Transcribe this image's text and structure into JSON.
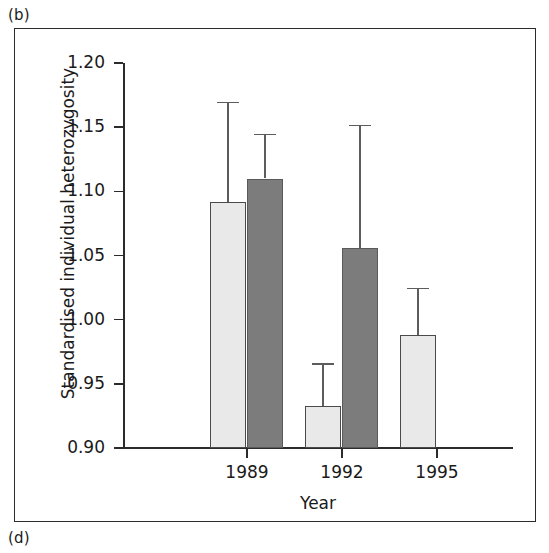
{
  "panel_labels": {
    "top": "(b)",
    "bottom": "(d)"
  },
  "chart_data": {
    "type": "bar",
    "title": "",
    "subtitle": "",
    "xlabel": "Year",
    "ylabel": "Standardised individual heterozygosity",
    "categories": [
      "1989",
      "1992",
      "1995"
    ],
    "ylim": [
      0.9,
      1.2
    ],
    "yticks": [
      "0.90",
      "0.95",
      "1.00",
      "1.05",
      "1.10",
      "1.15",
      "1.20"
    ],
    "ytick_values": [
      0.9,
      0.95,
      1.0,
      1.05,
      1.1,
      1.15,
      1.2
    ],
    "grid": false,
    "legend": "none",
    "error_bars": "upper only (SE/CI)",
    "colors": {
      "light_bar_fill": "#e9e9e9",
      "light_bar_edge": "#4a4a4a",
      "dark_bar_fill": "#7c7c7c",
      "dark_bar_edge": "#5a5a5a",
      "axis": "#2b2b2b",
      "error_bar": "#5c5c5c",
      "frame": "#2b2b2b",
      "background": "#ffffff"
    },
    "series": [
      {
        "name": "light",
        "style": "light",
        "values": [
          1.092,
          0.933,
          0.988
        ],
        "error_upper": [
          1.17,
          0.966,
          1.025
        ]
      },
      {
        "name": "dark",
        "style": "dark",
        "values": [
          1.11,
          1.056,
          null
        ],
        "error_upper": [
          1.145,
          1.152,
          null
        ]
      }
    ],
    "bars": [
      {
        "category": "1989",
        "series": "light",
        "value": 1.092,
        "error_upper": 1.17,
        "x_center_px": 213,
        "width_px": 36
      },
      {
        "category": "1989",
        "series": "dark",
        "value": 1.11,
        "error_upper": 1.145,
        "x_center_px": 250,
        "width_px": 36
      },
      {
        "category": "1992",
        "series": "light",
        "value": 0.933,
        "error_upper": 0.966,
        "x_center_px": 308,
        "width_px": 36
      },
      {
        "category": "1992",
        "series": "dark",
        "value": 1.056,
        "error_upper": 1.152,
        "x_center_px": 345,
        "width_px": 36
      },
      {
        "category": "1995",
        "series": "light",
        "value": 0.988,
        "error_upper": 1.025,
        "x_center_px": 403,
        "width_px": 36
      }
    ],
    "xtick_centers_px": [
      232,
      327,
      422
    ]
  }
}
